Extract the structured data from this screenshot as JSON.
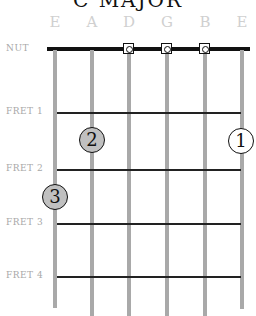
{
  "title": "C MAJOR",
  "strings": [
    {
      "name": "E",
      "x": 55,
      "bottom": 308
    },
    {
      "name": "A",
      "x": 92,
      "bottom": 316
    },
    {
      "name": "D",
      "x": 129,
      "bottom": 316
    },
    {
      "name": "G",
      "x": 167,
      "bottom": 316
    },
    {
      "name": "B",
      "x": 205,
      "bottom": 316
    },
    {
      "name": "E",
      "x": 242,
      "bottom": 309
    }
  ],
  "nut_label": "NUT",
  "frets": [
    {
      "label": "FRET 1",
      "y": 113
    },
    {
      "label": "FRET 2",
      "y": 170
    },
    {
      "label": "FRET 3",
      "y": 224
    },
    {
      "label": "FRET 4",
      "y": 277
    }
  ],
  "open_strings": [
    "D",
    "G",
    "B"
  ],
  "fingers": [
    {
      "finger": "1",
      "string": "high E",
      "fret": 1,
      "x": 241,
      "y": 141,
      "fill": "#ffffff"
    },
    {
      "finger": "2",
      "string": "A",
      "fret": 1.5,
      "x": 92,
      "y": 140,
      "fill": "#c0c0c0"
    },
    {
      "finger": "3",
      "string": "low E",
      "fret": 2.5,
      "x": 55,
      "y": 197,
      "fill": "#c0c0c0"
    }
  ],
  "colors": {
    "nut": "#111111",
    "string": "#a9a9a9",
    "fret": "#222222",
    "label": "#a8a8a8",
    "string_label": "#d0d0d0",
    "finger_fill_gray": "#c0c0c0"
  }
}
